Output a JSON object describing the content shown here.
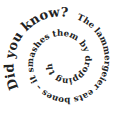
{
  "heading": "Did you know?",
  "fact": "The lammergeier eats bones – it smashes them by dropping them from a great height.",
  "colors": {
    "text": "#222222",
    "background": "#ffffff"
  }
}
